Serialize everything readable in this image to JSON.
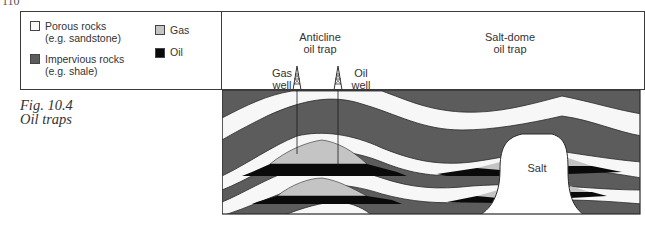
{
  "page_number": "110",
  "legend": {
    "items": [
      {
        "key": "porous",
        "line1": "Porous rocks",
        "line2": "(e.g. sandstone)",
        "color": "#f7f7f7"
      },
      {
        "key": "impervious",
        "line1": "Impervious rocks",
        "line2": "(e.g. shale)",
        "color": "#5c5c5c"
      },
      {
        "key": "gas",
        "line1": "Gas",
        "color": "#c4c4c4"
      },
      {
        "key": "oil",
        "line1": "Oil",
        "color": "#0a0a0a"
      }
    ]
  },
  "caption": {
    "figure": "Fig. 10.4",
    "title": "Oil traps"
  },
  "diagram": {
    "anticline_label_1": "Anticline",
    "anticline_label_2": "oil trap",
    "saltdome_label_1": "Salt-dome",
    "saltdome_label_2": "oil trap",
    "gas_well_1": "Gas",
    "gas_well_2": "well",
    "oil_well_1": "Oil",
    "oil_well_2": "well",
    "salt_label": "Salt",
    "colors": {
      "shale": "#5c5c5c",
      "sandstone": "#f7f7f7",
      "gas": "#c4c4c4",
      "oil": "#0a0a0a",
      "salt": "#ffffff",
      "outline": "#2a2a2a"
    }
  }
}
